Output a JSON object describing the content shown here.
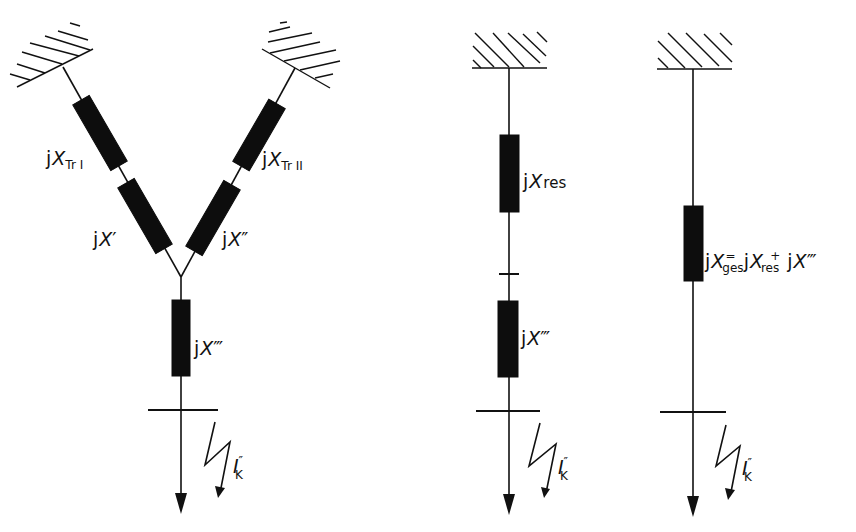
{
  "diagram": {
    "panels": [
      {
        "id": "parallel-transformers",
        "elements": [
          {
            "label_prefix": "j",
            "symbol": "X",
            "subscript": "TrI",
            "type": "reactance"
          },
          {
            "label_prefix": "j",
            "symbol": "X",
            "suffix": "'",
            "type": "reactance"
          },
          {
            "label_prefix": "j",
            "symbol": "X",
            "subscript": "TrII",
            "type": "reactance"
          },
          {
            "label_prefix": "j",
            "symbol": "X",
            "suffix": "''",
            "type": "reactance"
          },
          {
            "label_prefix": "j",
            "symbol": "X",
            "suffix": "'''",
            "type": "reactance"
          }
        ],
        "fault_current": {
          "symbol": "I",
          "superscript": "''",
          "subscript": "K"
        }
      },
      {
        "id": "series-equivalent",
        "elements": [
          {
            "label_prefix": "j",
            "symbol": "X",
            "subscript": "res",
            "type": "reactance"
          },
          {
            "label_prefix": "j",
            "symbol": "X",
            "suffix": "'''",
            "type": "reactance"
          }
        ],
        "fault_current": {
          "symbol": "I",
          "superscript": "''",
          "subscript": "K"
        }
      },
      {
        "id": "total-equivalent",
        "elements": [
          {
            "equation": "jX_ges = jX_res + jX'''",
            "type": "reactance"
          }
        ],
        "fault_current": {
          "symbol": "I",
          "superscript": "''",
          "subscript": "K"
        }
      }
    ],
    "labels": {
      "j": "j",
      "X": "X",
      "TrI": "Tr I",
      "TrII": "Tr II",
      "prime1": "′",
      "prime2": "″",
      "prime3": "‴",
      "res": "res",
      "ges": "ges",
      "eq": "=",
      "plus": "+",
      "I": "I",
      "K": "K"
    }
  }
}
